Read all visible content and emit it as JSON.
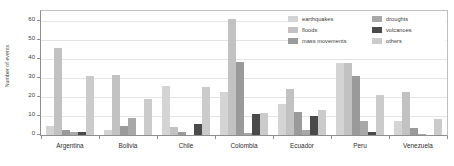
{
  "chart_data": {
    "type": "bar",
    "title": "",
    "subtitle": "",
    "xlabel": "",
    "ylabel": "Number of events",
    "ylim": [
      0,
      65
    ],
    "yticks": [
      0,
      10,
      20,
      30,
      40,
      50,
      60
    ],
    "grid": true,
    "grouped": true,
    "legend_position": "top-right",
    "categories": [
      "Argentina",
      "Bolivia",
      "Chile",
      "Colombia",
      "Ecuador",
      "Peru",
      "Venezuela"
    ],
    "series": [
      {
        "name": "earthquakes",
        "color": "#d4d4d4",
        "values": [
          4.8,
          2.5,
          25.8,
          22.8,
          16.2,
          37.8,
          7.5
        ]
      },
      {
        "name": "floods",
        "color": "#c2c2c2",
        "values": [
          45.8,
          31.5,
          4.0,
          60.8,
          23.9,
          37.8,
          22.5
        ]
      },
      {
        "name": "mass movements",
        "color": "#9a9a9a",
        "values": [
          2.6,
          4.5,
          1.5,
          38.1,
          11.9,
          30.8,
          3.6
        ]
      },
      {
        "name": "droughts",
        "color": "#a8a8a8",
        "values": [
          1.4,
          8.8,
          0.0,
          0.9,
          2.5,
          7.3,
          0.6
        ]
      },
      {
        "name": "volcanoes",
        "color": "#4a4a4a",
        "values": [
          1.5,
          0.0,
          5.9,
          10.8,
          9.9,
          1.5,
          0.0
        ]
      },
      {
        "name": "others",
        "color": "#cbcbcb",
        "values": [
          30.9,
          19.0,
          25.1,
          11.8,
          13.0,
          20.8,
          8.6
        ]
      }
    ]
  },
  "axes": {
    "y_title": "Number of events",
    "y_tick_labels": [
      "0",
      "10",
      "20",
      "30",
      "40",
      "50",
      "60"
    ],
    "x_tick_labels": [
      "Argentina",
      "Bolivia",
      "Chile",
      "Colombia",
      "Ecuador",
      "Peru",
      "Venezuela"
    ]
  },
  "legend": {
    "column_a": [
      {
        "label": "earthquakes",
        "swatch_color": "#d4d4d4",
        "icon": "legend-swatch-icon"
      },
      {
        "label": "floods",
        "swatch_color": "#c2c2c2",
        "icon": "legend-swatch-icon"
      },
      {
        "label": "mass movements",
        "swatch_color": "#9a9a9a",
        "icon": "legend-swatch-icon"
      }
    ],
    "column_b": [
      {
        "label": "droughts",
        "swatch_color": "#a8a8a8",
        "icon": "legend-swatch-icon"
      },
      {
        "label": "volcanoes",
        "swatch_color": "#4a4a4a",
        "icon": "legend-swatch-icon"
      },
      {
        "label": "others",
        "swatch_color": "#cbcbcb",
        "icon": "legend-swatch-icon"
      }
    ]
  },
  "colors": {
    "axis": "#8e8e8e",
    "grid": "#e4e4e4",
    "text": "#3a3a3a",
    "background": "#ffffff"
  }
}
